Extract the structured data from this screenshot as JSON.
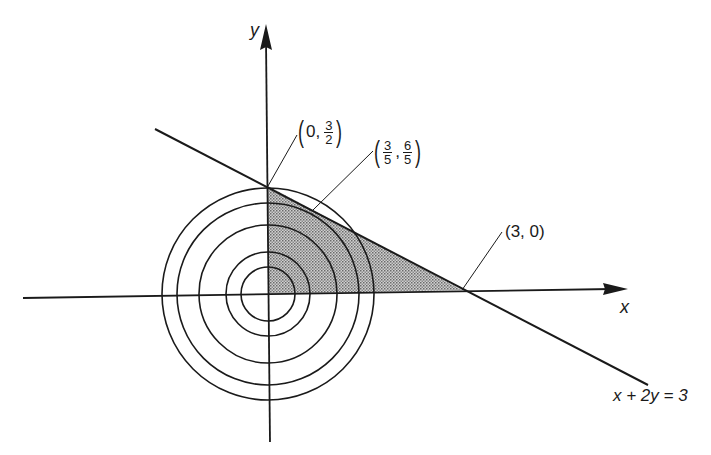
{
  "diagram": {
    "title": "",
    "axes": {
      "x_label": "x",
      "y_label": "y"
    },
    "line": {
      "equation": "x + 2y = 3",
      "color": "#1a1a1a"
    },
    "points": [
      {
        "id": "p1",
        "x": 0,
        "y": 1.5,
        "label_prefix": "0,",
        "frac_num": "3",
        "frac_den": "2"
      },
      {
        "id": "p2",
        "x": 0.6,
        "y": 1.2,
        "frac1_num": "3",
        "frac1_den": "5",
        "frac2_num": "6",
        "frac2_den": "5"
      },
      {
        "id": "p3",
        "x": 3,
        "y": 0,
        "label": "(3, 0)"
      }
    ],
    "level_circles": {
      "count": 5,
      "center": [
        0,
        0
      ]
    },
    "shaded_region": {
      "vertices": [
        "(0, 0)",
        "(0, 3/2)",
        "(3, 0)"
      ],
      "fill": "#b5b5b5"
    }
  }
}
